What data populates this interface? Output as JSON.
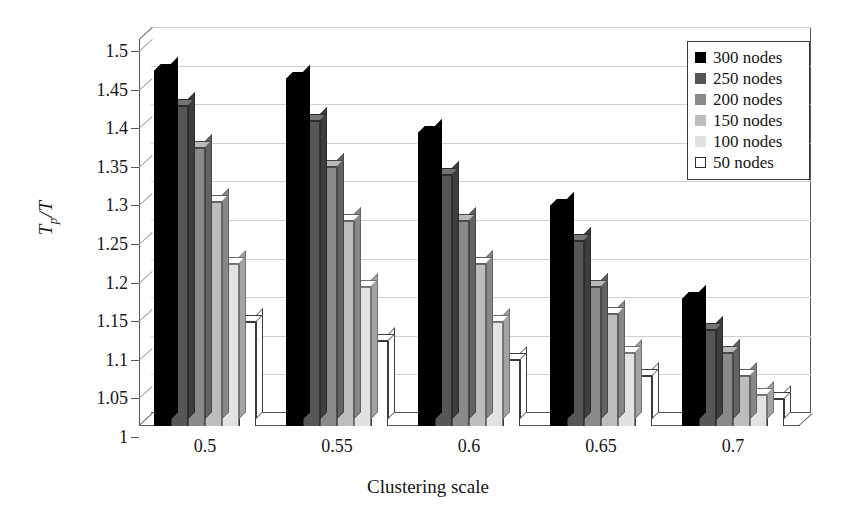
{
  "chart_data": {
    "type": "bar",
    "title": "",
    "xlabel": "Clustering scale",
    "ylabel": "Tp/T",
    "ylabel_main": "T",
    "ylabel_sub": "p",
    "ylabel_tail": "/T",
    "categories": [
      "0.5",
      "0.55",
      "0.6",
      "0.65",
      "0.7"
    ],
    "ylim": [
      1,
      1.5
    ],
    "yticks": [
      "1",
      "1.05",
      "1.1",
      "1.15",
      "1.2",
      "1.25",
      "1.3",
      "1.35",
      "1.4",
      "1.45",
      "1.5"
    ],
    "ytick_values": [
      1,
      1.05,
      1.1,
      1.15,
      1.2,
      1.25,
      1.3,
      1.35,
      1.4,
      1.45,
      1.5
    ],
    "grid": true,
    "legend_position": "top-right",
    "series": [
      {
        "name": "300 nodes",
        "color": "#000000",
        "values": [
          1.46,
          1.45,
          1.38,
          1.285,
          1.165
        ]
      },
      {
        "name": "250 nodes",
        "color": "#565656",
        "values": [
          1.415,
          1.395,
          1.325,
          1.24,
          1.125
        ]
      },
      {
        "name": "200 nodes",
        "color": "#8a8a8a",
        "values": [
          1.36,
          1.335,
          1.265,
          1.18,
          1.095
        ]
      },
      {
        "name": "150 nodes",
        "color": "#bdbdbd",
        "values": [
          1.29,
          1.265,
          1.21,
          1.145,
          1.065
        ]
      },
      {
        "name": "100 nodes",
        "color": "#e2e2e2",
        "values": [
          1.21,
          1.18,
          1.135,
          1.095,
          1.04
        ]
      },
      {
        "name": "50 nodes",
        "color": "#ffffff",
        "values": [
          1.135,
          1.11,
          1.085,
          1.065,
          1.035
        ]
      }
    ]
  },
  "legend": {
    "items": [
      {
        "label": "300 nodes",
        "color": "#000000"
      },
      {
        "label": "250 nodes",
        "color": "#565656"
      },
      {
        "label": "200 nodes",
        "color": "#8a8a8a"
      },
      {
        "label": "150 nodes",
        "color": "#bdbdbd"
      },
      {
        "label": "100 nodes",
        "color": "#e2e2e2"
      },
      {
        "label": "50 nodes",
        "color": "#ffffff"
      }
    ]
  },
  "axes": {
    "y_title_main": "T",
    "y_title_sub": "p",
    "y_title_tail": "/T",
    "x_title": "Clustering scale"
  }
}
